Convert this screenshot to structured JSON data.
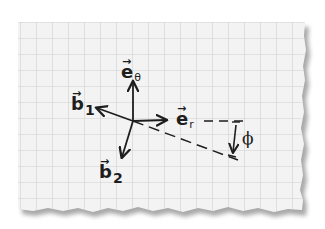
{
  "diagram": {
    "colors": {
      "paper": "#f4f4f4",
      "grid": "#d2d2d2",
      "ink": "#1e1e1e",
      "shadow": "#9a9a9a",
      "background": "#ffffff"
    },
    "labels": {
      "e_theta": {
        "base": "e",
        "hat": "→",
        "subscript": "θ"
      },
      "e_r": {
        "base": "e",
        "hat": "→",
        "subscript": "r"
      },
      "b_1": {
        "base": "b",
        "hat": "→",
        "subscript": "1"
      },
      "b_2": {
        "base": "b",
        "hat": "→",
        "subscript": "2"
      },
      "angle": "ϕ"
    },
    "vectors": [
      {
        "name": "e_theta",
        "direction": "up"
      },
      {
        "name": "e_r",
        "direction": "right"
      },
      {
        "name": "b_1",
        "direction": "up-left"
      },
      {
        "name": "b_2",
        "direction": "down-left"
      }
    ],
    "annotations": [
      {
        "type": "dashed-line",
        "description": "extension of e_r to the right"
      },
      {
        "type": "dashed-line",
        "description": "rotated axis from origin down-right"
      },
      {
        "type": "angle-arrow",
        "label": "ϕ",
        "description": "angle between e_r extension and rotated axis"
      }
    ]
  }
}
